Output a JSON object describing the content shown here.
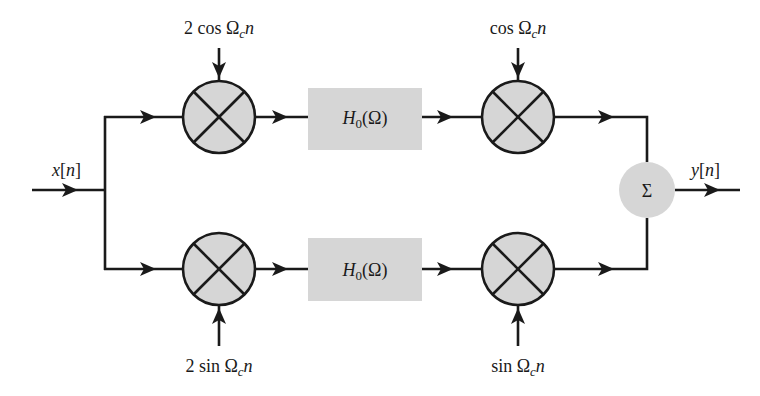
{
  "diagram": {
    "colors": {
      "line": "#1a1a1a",
      "fill": "#d6d6d6",
      "background": "#ffffff"
    },
    "input": {
      "label": "x[n]"
    },
    "output": {
      "label": "y[n]"
    },
    "top_branch": {
      "mixer1": {
        "symbol": "×",
        "carrier_label": "2 cos Ω_c n",
        "carrier_text": {
          "coef": "2 cos ",
          "omega": "Ω",
          "sub": "c",
          "var": "n"
        }
      },
      "filter": {
        "label": "H_0(Ω)",
        "text": {
          "h": "H",
          "sub": "0",
          "arg": "(Ω)"
        }
      },
      "mixer2": {
        "symbol": "×",
        "carrier_label": "cos Ω_c n",
        "carrier_text": {
          "coef": "cos ",
          "omega": "Ω",
          "sub": "c",
          "var": "n"
        }
      }
    },
    "bottom_branch": {
      "mixer1": {
        "symbol": "×",
        "carrier_label": "2 sin Ω_c n",
        "carrier_text": {
          "coef": "2 sin ",
          "omega": "Ω",
          "sub": "c",
          "var": "n"
        }
      },
      "filter": {
        "label": "H_0(Ω)",
        "text": {
          "h": "H",
          "sub": "0",
          "arg": "(Ω)"
        }
      },
      "mixer2": {
        "symbol": "×",
        "carrier_label": "sin Ω_c n",
        "carrier_text": {
          "coef": "sin ",
          "omega": "Ω",
          "sub": "c",
          "var": "n"
        }
      }
    },
    "summer": {
      "symbol": "Σ"
    },
    "input_text": {
      "x": "x",
      "open": "[",
      "n": "n",
      "close": "]"
    },
    "output_text": {
      "y": "y",
      "open": "[",
      "n": "n",
      "close": "]"
    }
  }
}
